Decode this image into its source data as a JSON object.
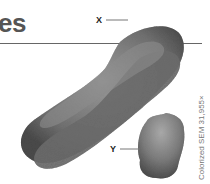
{
  "heading": {
    "text": "es"
  },
  "figure": {
    "labels": {
      "x": "X",
      "y": "Y"
    },
    "caption": "Colorized SEM 31,955×",
    "colors": {
      "chromosome_dark": "#5a5a5a",
      "chromosome_mid": "#8a8a8a",
      "chromosome_light": "#b5b5b5",
      "rule": "#666666",
      "heading": "#555555"
    }
  }
}
